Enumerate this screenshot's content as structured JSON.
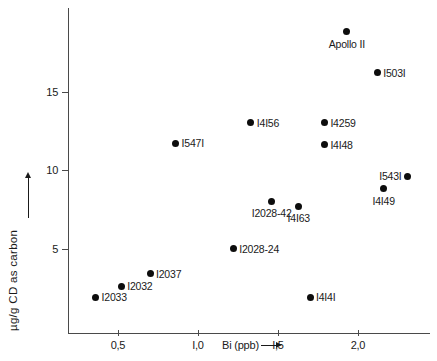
{
  "chart_data": {
    "type": "scatter",
    "title": "",
    "xlabel": "Bi (ppb)",
    "ylabel": "µg/g CD  as  carbon",
    "xlim": [
      0.1,
      2.35
    ],
    "ylim": [
      0.3,
      19.5
    ],
    "grid": false,
    "legend": "none",
    "x_ticks": [
      {
        "value": 0.5,
        "label": "0,5"
      },
      {
        "value": 1.0,
        "label": "I,0"
      },
      {
        "value": 1.5,
        "label": "I,5"
      },
      {
        "value": 2.0,
        "label": "2,0"
      }
    ],
    "y_ticks": [
      {
        "value": 5,
        "label": "5"
      },
      {
        "value": 10,
        "label": "10"
      },
      {
        "value": 15,
        "label": "15"
      }
    ],
    "points": [
      {
        "label": "Apollo II",
        "x": 1.93,
        "y": 18.8,
        "label_pos": "below"
      },
      {
        "label": "I503I",
        "x": 2.12,
        "y": 16.2,
        "label_pos": "right"
      },
      {
        "label": "I4I56",
        "x": 1.33,
        "y": 13.0,
        "label_pos": "right"
      },
      {
        "label": "I4259",
        "x": 1.79,
        "y": 13.0,
        "label_pos": "right"
      },
      {
        "label": "I547I",
        "x": 0.86,
        "y": 11.7,
        "label_pos": "right"
      },
      {
        "label": "I4I48",
        "x": 1.79,
        "y": 11.6,
        "label_pos": "right"
      },
      {
        "label": "I543I",
        "x": 2.31,
        "y": 9.6,
        "label_pos": "left"
      },
      {
        "label": "I4I49",
        "x": 2.16,
        "y": 8.8,
        "label_pos": "below"
      },
      {
        "label": "I2028-42",
        "x": 1.46,
        "y": 8.0,
        "label_pos": "below"
      },
      {
        "label": "I4I63",
        "x": 1.63,
        "y": 7.7,
        "label_pos": "below"
      },
      {
        "label": "I2028-24",
        "x": 1.22,
        "y": 5.0,
        "label_pos": "right"
      },
      {
        "label": "I2037",
        "x": 0.7,
        "y": 3.4,
        "label_pos": "right"
      },
      {
        "label": "I2032",
        "x": 0.52,
        "y": 2.6,
        "label_pos": "right"
      },
      {
        "label": "I2033",
        "x": 0.36,
        "y": 1.9,
        "label_pos": "right"
      },
      {
        "label": "I4I4I",
        "x": 1.7,
        "y": 1.9,
        "label_pos": "right"
      }
    ],
    "colors": {
      "marker": "#0d0d0d",
      "axis": "#4a4a4a",
      "text": "#1a1a1a",
      "background": "#ffffff"
    }
  },
  "axis_arrows": {
    "x_arrow": "right-arrow-icon",
    "y_arrow": "up-arrow-icon"
  }
}
